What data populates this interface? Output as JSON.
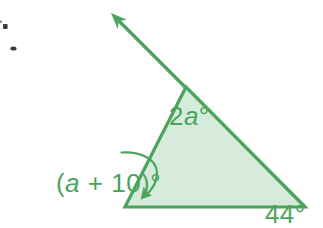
{
  "figure": {
    "colors": {
      "background": "#FFFFFF",
      "line": "#4BA45D",
      "fill": "#D7EBDC",
      "label": "#4BA45D",
      "artifact": "#3A3A3A"
    },
    "icons": {
      "ray_arrowhead": "arrow-up-left-icon",
      "angle_pointer": "curved-arrow-down-left-icon"
    },
    "angle_labels": {
      "exterior_top": {
        "coefficient": "2",
        "variable": "a",
        "degree": "°"
      },
      "interior_bottom_left": {
        "open_paren": "(",
        "variable": "a",
        "rest": " + 10)",
        "degree": "°"
      },
      "interior_bottom_right": {
        "value": "44",
        "degree": "°"
      }
    }
  }
}
